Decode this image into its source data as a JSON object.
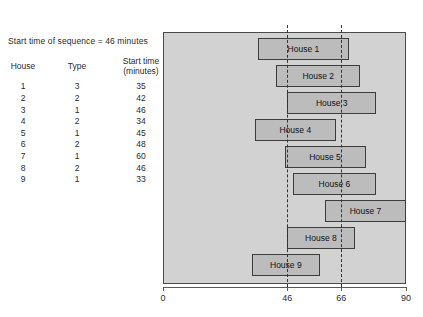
{
  "caption": "Start time of sequence = 46 minutes",
  "table": {
    "headers": [
      "House",
      "Type",
      "Start time (minutes)"
    ],
    "rows": [
      {
        "house": "1",
        "type": "3",
        "start": "35"
      },
      {
        "house": "2",
        "type": "2",
        "start": "42"
      },
      {
        "house": "3",
        "type": "1",
        "start": "46"
      },
      {
        "house": "4",
        "type": "2",
        "start": "34"
      },
      {
        "house": "5",
        "type": "1",
        "start": "45"
      },
      {
        "house": "6",
        "type": "2",
        "start": "48"
      },
      {
        "house": "7",
        "type": "1",
        "start": "60"
      },
      {
        "house": "8",
        "type": "2",
        "start": "46"
      },
      {
        "house": "9",
        "type": "1",
        "start": "33"
      }
    ]
  },
  "chart_data": {
    "type": "bar",
    "orientation": "horizontal-gantt",
    "title": "",
    "xlabel": "",
    "ylabel": "",
    "xlim": [
      0,
      90
    ],
    "grid": false,
    "legend": false,
    "xticks": [
      "0",
      "46",
      "66",
      "90"
    ],
    "xtick_values": [
      0,
      46,
      66,
      90
    ],
    "reference_lines": [
      46,
      66
    ],
    "colors": {
      "plot_background": "#d2d2d2",
      "bar_fill": "#bcbcbc",
      "bar_border": "#3c3c3c",
      "reference_line": "#333333"
    },
    "categories": [
      "House 1",
      "House 2",
      "House 3",
      "House 4",
      "House 5",
      "House 6",
      "House 7",
      "House 8",
      "House 9"
    ],
    "bars": [
      {
        "label": "House 1",
        "start": 35,
        "end": 69,
        "duration": 34
      },
      {
        "label": "House 2",
        "start": 42,
        "end": 73,
        "duration": 31
      },
      {
        "label": "House 3",
        "start": 46,
        "end": 79,
        "duration": 33
      },
      {
        "label": "House 4",
        "start": 34,
        "end": 64,
        "duration": 30
      },
      {
        "label": "House 5",
        "start": 45,
        "end": 75,
        "duration": 30
      },
      {
        "label": "House 6",
        "start": 48,
        "end": 79,
        "duration": 31
      },
      {
        "label": "House 7",
        "start": 60,
        "end": 90,
        "duration": 30
      },
      {
        "label": "House 8",
        "start": 46,
        "end": 71,
        "duration": 25
      },
      {
        "label": "House 9",
        "start": 33,
        "end": 58,
        "duration": 25
      }
    ]
  }
}
